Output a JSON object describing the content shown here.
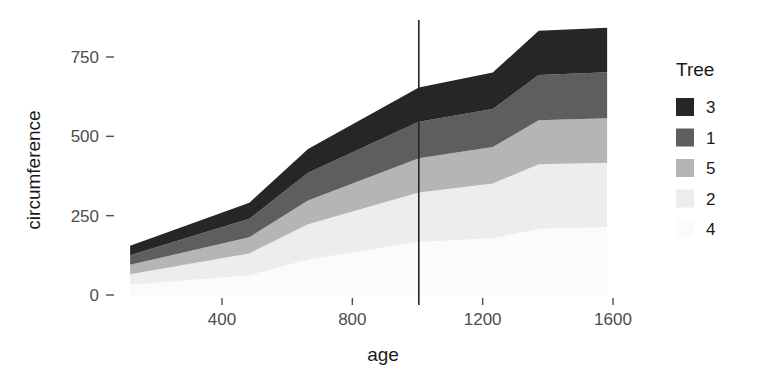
{
  "chart_data": {
    "type": "area",
    "stacked": true,
    "title": "",
    "subtitle": "",
    "xlabel": "age",
    "ylabel": "circumference",
    "xlim": [
      118,
      1582
    ],
    "ylim": [
      0,
      888
    ],
    "xticks": [
      400,
      800,
      1200,
      1600
    ],
    "xticklabels": [
      "400",
      "800",
      "1200",
      "1600"
    ],
    "yticks": [
      0,
      250,
      500,
      750
    ],
    "yticklabels": [
      "0",
      "250",
      "500",
      "750"
    ],
    "grid": false,
    "legend": {
      "title": "Tree",
      "position": "right",
      "entries": [
        {
          "label": "3",
          "color": "#262626"
        },
        {
          "label": "1",
          "color": "#5e5e5e"
        },
        {
          "label": "5",
          "color": "#b5b5b5"
        },
        {
          "label": "2",
          "color": "#ededed"
        },
        {
          "label": "4",
          "color": "#fbfbfb"
        }
      ]
    },
    "x": [
      118,
      484,
      664,
      1004,
      1231,
      1372,
      1582
    ],
    "series": [
      {
        "name": "4",
        "color": "#fbfbfb",
        "values": [
          32,
          62,
          112,
          167,
          179,
          209,
          214
        ]
      },
      {
        "name": "2",
        "color": "#ededed",
        "values": [
          33,
          69,
          111,
          156,
          172,
          203,
          203
        ]
      },
      {
        "name": "5",
        "color": "#b5b5b5",
        "values": [
          30,
          51,
          75,
          108,
          115,
          139,
          140
        ]
      },
      {
        "name": "1",
        "color": "#5e5e5e",
        "values": [
          30,
          58,
          87,
          115,
          120,
          142,
          145
        ]
      },
      {
        "name": "3",
        "color": "#262626",
        "values": [
          30,
          51,
          75,
          108,
          115,
          140,
          140
        ]
      }
    ],
    "stack_order_bottom_to_top": [
      "4",
      "2",
      "5",
      "1",
      "3"
    ],
    "annotations": [
      {
        "type": "vline",
        "name": "reference-line",
        "x": 1004,
        "color": "#262626"
      }
    ],
    "cumulative_totals": [
      155,
      291,
      460,
      654,
      701,
      833,
      842
    ]
  }
}
